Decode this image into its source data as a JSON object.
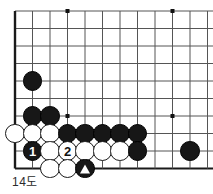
{
  "caption": "14도",
  "board": {
    "name": "go-board-diagram",
    "line_color": "#555555",
    "edge_color": "#1a1a1a",
    "background": "#ffffff",
    "cell_size": 17.5,
    "origin_x": 15,
    "origin_y": 11,
    "cols": 12,
    "rows": 10,
    "left_edge_col": 0,
    "bottom_edge_row": 9,
    "star_points": [
      {
        "col": 3,
        "row": 0
      },
      {
        "col": 3,
        "row": 6
      },
      {
        "col": 9,
        "row": 0
      },
      {
        "col": 9,
        "row": 6
      }
    ]
  },
  "stones": [
    {
      "id": "b-c1r4",
      "color": "black",
      "col": 1,
      "row": 4,
      "label": "",
      "marker": ""
    },
    {
      "id": "b-c1r6",
      "color": "black",
      "col": 1,
      "row": 6,
      "label": "",
      "marker": ""
    },
    {
      "id": "b-c2r6",
      "color": "black",
      "col": 2,
      "row": 6,
      "label": "",
      "marker": ""
    },
    {
      "id": "w-c0r7",
      "color": "white",
      "col": 0,
      "row": 7,
      "label": "",
      "marker": ""
    },
    {
      "id": "w-c1r7",
      "color": "white",
      "col": 1,
      "row": 7,
      "label": "",
      "marker": ""
    },
    {
      "id": "w-c2r7",
      "color": "white",
      "col": 2,
      "row": 7,
      "label": "",
      "marker": ""
    },
    {
      "id": "b-c3r7",
      "color": "black",
      "col": 3,
      "row": 7,
      "label": "",
      "marker": ""
    },
    {
      "id": "b-c4r7",
      "color": "black",
      "col": 4,
      "row": 7,
      "label": "",
      "marker": ""
    },
    {
      "id": "b-c5r7",
      "color": "black",
      "col": 5,
      "row": 7,
      "label": "",
      "marker": ""
    },
    {
      "id": "b-c6r7",
      "color": "black",
      "col": 6,
      "row": 7,
      "label": "",
      "marker": ""
    },
    {
      "id": "b-c7r7",
      "color": "black",
      "col": 7,
      "row": 7,
      "label": "",
      "marker": ""
    },
    {
      "id": "b-c1r8",
      "color": "black",
      "col": 1,
      "row": 8,
      "label": "1",
      "marker": ""
    },
    {
      "id": "w-c2r8",
      "color": "white",
      "col": 2,
      "row": 8,
      "label": "",
      "marker": ""
    },
    {
      "id": "w-c3r8",
      "color": "white",
      "col": 3,
      "row": 8,
      "label": "2",
      "marker": ""
    },
    {
      "id": "w-c4r8",
      "color": "white",
      "col": 4,
      "row": 8,
      "label": "",
      "marker": ""
    },
    {
      "id": "w-c5r8",
      "color": "white",
      "col": 5,
      "row": 8,
      "label": "",
      "marker": ""
    },
    {
      "id": "w-c6r8",
      "color": "white",
      "col": 6,
      "row": 8,
      "label": "",
      "marker": ""
    },
    {
      "id": "b-c7r8",
      "color": "black",
      "col": 7,
      "row": 8,
      "label": "",
      "marker": ""
    },
    {
      "id": "b-c10r8",
      "color": "black",
      "col": 10,
      "row": 8,
      "label": "",
      "marker": ""
    },
    {
      "id": "w-c2r9",
      "color": "white",
      "col": 2,
      "row": 9,
      "label": "",
      "marker": ""
    },
    {
      "id": "w-c3r9",
      "color": "white",
      "col": 3,
      "row": 9,
      "label": "",
      "marker": ""
    },
    {
      "id": "b-c4r9",
      "color": "black",
      "col": 4,
      "row": 9,
      "label": "",
      "marker": "triangle"
    }
  ]
}
